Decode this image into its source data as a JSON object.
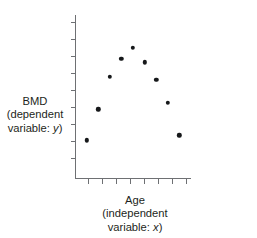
{
  "chart_data": {
    "type": "scatter",
    "title": "",
    "xlabel": "Age (independent variable: x)",
    "ylabel": "BMD (dependent variable: y)",
    "grid": false,
    "legend": null,
    "xlim": [
      0,
      10
    ],
    "ylim": [
      0,
      10
    ],
    "axis_tick_labels_shown": false,
    "x_tick_count": 8,
    "y_tick_count": 9,
    "series": [
      {
        "name": "BMD vs Age",
        "marker": "filled-circle",
        "color": "#16181a",
        "points": [
          {
            "x": 1.0,
            "y": 2.3
          },
          {
            "x": 2.0,
            "y": 4.2
          },
          {
            "x": 3.0,
            "y": 6.2
          },
          {
            "x": 4.0,
            "y": 7.3
          },
          {
            "x": 5.0,
            "y": 8.0
          },
          {
            "x": 6.0,
            "y": 7.1
          },
          {
            "x": 7.0,
            "y": 6.0
          },
          {
            "x": 8.0,
            "y": 4.6
          },
          {
            "x": 9.0,
            "y": 2.6
          }
        ]
      }
    ]
  },
  "labels": {
    "y_axis": {
      "line1": "BMD",
      "line2": "(dependent",
      "line3_prefix": "variable: ",
      "line3_variable": "y",
      "line3_suffix": ")"
    },
    "x_axis": {
      "line1": "Age",
      "line2": "(independent",
      "line3_prefix": "variable: ",
      "line3_variable": "x",
      "line3_suffix": ")"
    }
  },
  "colors": {
    "axis": "#6e7073",
    "marker": "#16181a",
    "text": "#1d1f21",
    "background": "#ffffff"
  }
}
